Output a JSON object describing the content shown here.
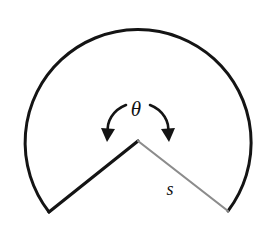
{
  "figure": {
    "name": "sector-angle-diagram",
    "background_color": "#ffffff",
    "labels": {
      "theta": "θ",
      "arc_radius": "s"
    },
    "geometry": {
      "center_x": 138,
      "center_y": 127,
      "radius": 113,
      "arc_start_angle_deg": 136,
      "arc_end_angle_deg": 44,
      "vertex_x": 138,
      "vertex_y": 141,
      "left_endpoint_x": 49,
      "left_endpoint_y": 212,
      "right_endpoint_x": 228,
      "right_endpoint_y": 211
    },
    "colors": {
      "arc_stroke": "#141414",
      "left_radius_stroke": "#141414",
      "right_radius_stroke": "#8c8c8c",
      "arrow_stroke": "#141414",
      "label_fill": "#111111"
    },
    "strokes": {
      "arc_width": 3.0,
      "left_radius_width": 3.2,
      "right_radius_width": 2.2,
      "arrow_width": 2.6
    },
    "label_positions": {
      "theta_x": 136,
      "theta_y": 116,
      "s_x": 170,
      "s_y": 195
    },
    "arrows": {
      "left": {
        "name": "angle-arrow-left",
        "path": "M 126 105 C 113 110, 106 122, 108 133",
        "head_points": "101,128 115,129 107,142"
      },
      "right": {
        "name": "angle-arrow-right",
        "path": "M 150 105 C 163 110, 170 122, 168 133",
        "head_points": "161,129 175,128 169,142"
      }
    }
  }
}
